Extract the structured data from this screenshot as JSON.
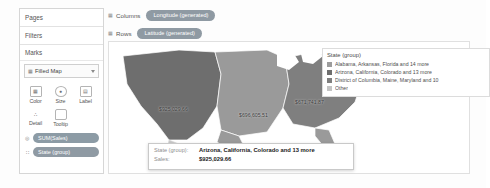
{
  "shelves": {
    "pages_label": "Pages",
    "filters_label": "Filters",
    "marks_label": "Marks",
    "columns_label": "Columns",
    "rows_label": "Rows",
    "columns_pill": "Longitude (generated)",
    "rows_pill": "Latitude (generated)"
  },
  "marks": {
    "type_label": "Filled Map",
    "type_icon": "filled-map-icon",
    "properties": [
      {
        "label": "Color",
        "icon": "color-palette-icon",
        "glyph": "▦"
      },
      {
        "label": "Size",
        "icon": "size-icon",
        "glyph": "○"
      },
      {
        "label": "Label",
        "icon": "label-icon",
        "glyph": "▤"
      },
      {
        "label": "Detail",
        "icon": "detail-icon",
        "glyph": "∴"
      },
      {
        "label": "Tooltip",
        "icon": "tooltip-icon",
        "glyph": "▭"
      }
    ],
    "pills": [
      {
        "label": "SUM(Sales)",
        "prefix": "◎",
        "kind": "green"
      },
      {
        "label": "State (group)",
        "prefix": "∷",
        "kind": "blue"
      }
    ]
  },
  "legend": {
    "title": "State (group)",
    "items": [
      {
        "label": "Alabama, Arkansas, Florida and 14 more",
        "color": "#9d9d9d"
      },
      {
        "label": "Arizona, California, Colorado and 13 more",
        "color": "#6e6e6e"
      },
      {
        "label": "District of Columbia, Maine, Maryland and 10",
        "color": "#7f7f7f"
      },
      {
        "label": "Other",
        "color": "#c4c4c4"
      }
    ]
  },
  "map_labels": [
    {
      "text": "$925,029.66",
      "x": 42,
      "y": 60
    },
    {
      "text": "$696,605.51",
      "x": 122,
      "y": 66
    },
    {
      "text": "$671,741.87",
      "x": 178,
      "y": 53
    },
    {
      "text": "$62,119",
      "x": 214,
      "y": 42
    }
  ],
  "tooltip": {
    "rows": [
      {
        "key": "State (group):",
        "value": "Arizona, California, Colorado and 13 more"
      },
      {
        "key": "Sales:",
        "value": "$925,029.66"
      }
    ]
  },
  "colors": {
    "region_west": "#6e6e6e",
    "region_central": "#9a9a9a",
    "region_east": "#7f7f7f",
    "region_light": "#c9c9c9",
    "pill": "#8f9aa3"
  }
}
